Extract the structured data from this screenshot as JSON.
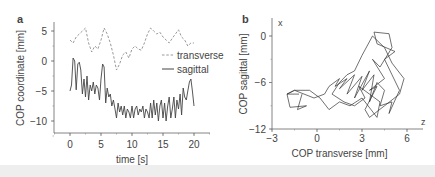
{
  "chart_data": [
    {
      "panel_label": "a",
      "type": "line",
      "title": "",
      "xlabel": "time [s]",
      "ylabel": "COP coordinate [mm]",
      "xlim": [
        -1,
        22
      ],
      "ylim": [
        -12,
        7
      ],
      "xticks": [
        0,
        5,
        10,
        15,
        20
      ],
      "yticks": [
        5,
        0,
        -5,
        -10
      ],
      "grid": false,
      "legend_position": "right-middle",
      "series": [
        {
          "name": "transverse",
          "style": "dashed",
          "color": "#999999",
          "x": [
            0,
            0.5,
            1,
            1.5,
            2,
            2.5,
            3,
            3.5,
            4,
            4.5,
            5,
            5.5,
            6,
            6.5,
            7,
            7.5,
            8,
            8.5,
            9,
            9.5,
            10,
            10.5,
            11,
            11.5,
            12,
            12.5,
            13,
            13.5,
            14,
            14.5,
            15,
            15.5,
            16,
            16.5,
            17,
            17.5,
            18,
            18.5,
            19,
            19.5,
            20
          ],
          "values": [
            3.5,
            3.0,
            4.0,
            4.5,
            5.0,
            5.5,
            3.0,
            1.5,
            2.5,
            2.0,
            3.5,
            5.5,
            4.5,
            3.0,
            1.0,
            -1.5,
            -0.5,
            1.0,
            1.5,
            0.5,
            2.0,
            2.5,
            2.0,
            1.8,
            3.0,
            4.5,
            5.5,
            5.0,
            4.5,
            4.8,
            4.0,
            3.5,
            3.0,
            3.8,
            4.5,
            5.2,
            4.0,
            3.5,
            2.5,
            3.0,
            3.0
          ]
        },
        {
          "name": "sagittal",
          "style": "solid",
          "color": "#444444",
          "x": [
            0,
            0.25,
            0.5,
            0.75,
            1,
            1.25,
            1.5,
            1.75,
            2,
            2.25,
            2.5,
            2.75,
            3,
            3.25,
            3.5,
            3.75,
            4,
            4.25,
            4.5,
            4.75,
            5,
            5.25,
            5.5,
            5.75,
            6,
            6.25,
            6.5,
            6.75,
            7,
            7.25,
            7.5,
            7.75,
            8,
            8.25,
            8.5,
            8.75,
            9,
            9.25,
            9.5,
            9.75,
            10,
            10.25,
            10.5,
            10.75,
            11,
            11.25,
            11.5,
            11.75,
            12,
            12.25,
            12.5,
            12.75,
            13,
            13.25,
            13.5,
            13.75,
            14,
            14.25,
            14.5,
            14.75,
            15,
            15.25,
            15.5,
            15.75,
            16,
            16.25,
            16.5,
            16.75,
            17,
            17.25,
            17.5,
            17.75,
            18,
            18.25,
            18.5,
            18.75,
            19,
            19.25,
            19.5,
            19.75,
            20
          ],
          "values": [
            -5.0,
            -4.0,
            0.5,
            0.0,
            -4.8,
            -0.5,
            -0.2,
            -1.5,
            -5.5,
            -3.0,
            -6.0,
            -2.5,
            -6.5,
            -4.0,
            -5.0,
            -3.5,
            -5.5,
            -4.0,
            -4.5,
            -6.5,
            -3.0,
            -0.5,
            -1.0,
            -7.0,
            -4.5,
            -6.0,
            -5.5,
            -7.5,
            -6.5,
            -8.0,
            -9.5,
            -7.0,
            -8.5,
            -7.5,
            -9.0,
            -7.5,
            -9.5,
            -8.0,
            -8.5,
            -9.5,
            -7.5,
            -9.5,
            -8.0,
            -7.5,
            -9.0,
            -8.0,
            -8.5,
            -7.5,
            -9.5,
            -8.0,
            -8.5,
            -9.5,
            -7.0,
            -9.5,
            -6.5,
            -9.0,
            -7.0,
            -10.0,
            -7.5,
            -6.5,
            -9.5,
            -7.0,
            -10.0,
            -7.5,
            -6.0,
            -9.5,
            -8.0,
            -6.0,
            -9.5,
            -6.5,
            -8.0,
            -5.5,
            -9.0,
            -4.5,
            -6.0,
            -6.5,
            -5.0,
            -3.5,
            -3.0,
            -5.0,
            -7.5
          ]
        }
      ]
    },
    {
      "panel_label": "b",
      "type": "line",
      "title": "",
      "xlabel": "COP transverse [mm]",
      "ylabel": "COP sagittal [mm]",
      "x_axis_letter": "z",
      "y_axis_letter": "x",
      "xlim": [
        -3,
        7
      ],
      "ylim": [
        -12,
        2
      ],
      "xticks": [
        -3,
        0,
        3,
        6
      ],
      "yticks": [
        0,
        -6,
        -12
      ],
      "grid": false,
      "series": [
        {
          "name": "stabilogram",
          "style": "solid",
          "color": "#333333",
          "x": [
            -1.0,
            -1.3,
            -0.7,
            -1.8,
            -2.0,
            -1.5,
            -0.2,
            0.5,
            0.8,
            1.5,
            1.2,
            2.0,
            1.5,
            2.5,
            2.0,
            3.0,
            2.5,
            3.5,
            3.0,
            3.8,
            3.5,
            4.0,
            4.5,
            4.2,
            5.0,
            4.8,
            5.5,
            5.0,
            4.5,
            5.2,
            4.0,
            3.8,
            4.8,
            5.0,
            4.2,
            3.7,
            4.5,
            3.5,
            4.0,
            3.2,
            3.5,
            4.5,
            5.5,
            5.8,
            5.0,
            4.5,
            3.7,
            3.0,
            2.5,
            2.0,
            1.5,
            1.0,
            1.8,
            2.5,
            3.2,
            2.8,
            3.5,
            4.2,
            4.0,
            3.6,
            3.0,
            2.2,
            1.5,
            0.8,
            0.2,
            -0.5,
            -1.5,
            -2.0,
            -1.2
          ],
          "values": [
            -7.5,
            -9.5,
            -9.0,
            -9.2,
            -7.5,
            -7.0,
            -8.0,
            -7.5,
            -6.5,
            -5.5,
            -6.5,
            -5.5,
            -6.8,
            -5.0,
            -7.5,
            -5.2,
            -8.0,
            -4.5,
            -7.0,
            -5.0,
            -8.5,
            -6.0,
            -7.0,
            -9.0,
            -8.5,
            -10.0,
            -7.0,
            -5.0,
            -3.0,
            -2.0,
            -1.0,
            0.5,
            0.3,
            -1.5,
            -4.0,
            -3.0,
            -5.5,
            -7.0,
            -6.5,
            -9.5,
            -10.5,
            -9.0,
            -7.5,
            -5.5,
            -3.5,
            -1.5,
            0.0,
            -2.5,
            -4.5,
            -5.0,
            -6.0,
            -7.5,
            -8.5,
            -9.0,
            -8.0,
            -6.5,
            -7.5,
            -8.5,
            -10.5,
            -9.5,
            -8.0,
            -9.0,
            -8.5,
            -9.5,
            -8.0,
            -7.0,
            -7.0,
            -7.5,
            -7.5
          ]
        }
      ]
    }
  ]
}
